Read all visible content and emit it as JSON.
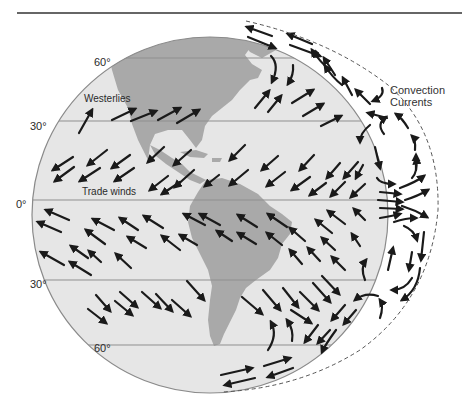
{
  "figure": {
    "colors": {
      "background": "#ffffff",
      "ocean": "#e6e6e6",
      "land": "#a9a9a9",
      "globe_outline": "#8a8a8a",
      "latitude_line": "#8f8f8f",
      "arrow": "#1a1a1a",
      "top_rule": "#333333",
      "dashed_boundary": "#555555"
    },
    "latitude_labels": {
      "n60": "60°",
      "n30": "30°",
      "eq": "0°",
      "s30": "30°",
      "s60": "60°"
    },
    "wind_labels": {
      "westerlies": "Westerlies",
      "trade_winds": "Trade winds"
    },
    "convection_label": {
      "line1": "Convection",
      "line2": "Currents"
    }
  }
}
